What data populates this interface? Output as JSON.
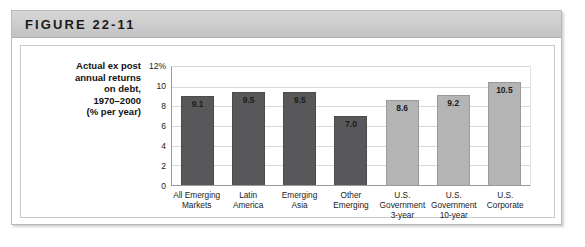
{
  "figure": {
    "title": "FIGURE 22-11",
    "caption": ""
  },
  "chart_data": {
    "type": "bar",
    "title": "",
    "ylabel_lines": [
      "Actual ex post",
      "annual returns",
      "on debt,",
      "1970–2000",
      "(% per year)"
    ],
    "xlabel": "",
    "ylim": [
      0,
      12
    ],
    "grid": true,
    "legend": "none",
    "y_ticks": [
      "12%",
      "10",
      "8",
      "6",
      "4",
      "2",
      "0"
    ],
    "y_tick_values": [
      12,
      10,
      8,
      6,
      4,
      2,
      0
    ],
    "categories": [
      "All Emerging Markets",
      "Latin America",
      "Emerging Asia",
      "Other Emerging",
      "U.S. Government 3-year",
      "U.S. Government 10-year",
      "U.S. Corporate"
    ],
    "category_lines": [
      [
        "All Emerging",
        "Markets"
      ],
      [
        "Latin",
        "America"
      ],
      [
        "Emerging",
        "Asia"
      ],
      [
        "Other",
        "Emerging"
      ],
      [
        "U.S.",
        "Government",
        "3-year"
      ],
      [
        "U.S.",
        "Government",
        "10-year"
      ],
      [
        "U.S.",
        "Corporate"
      ]
    ],
    "values": [
      9.1,
      9.5,
      9.5,
      7.0,
      8.6,
      9.2,
      10.5
    ],
    "value_labels": [
      "9.1",
      "9.5",
      "9.5",
      "7.0",
      "8.6",
      "9.2",
      "10.5"
    ],
    "bar_groups": [
      "emerging",
      "emerging",
      "emerging",
      "emerging",
      "us",
      "us",
      "us"
    ],
    "colors": {
      "emerging": "#58585a",
      "us": "#b4b4b4",
      "grid": "#d9d9d9",
      "axis": "#9a9a9a",
      "header_band": "#cccccc",
      "frame_border": "#b8b8b8"
    }
  }
}
